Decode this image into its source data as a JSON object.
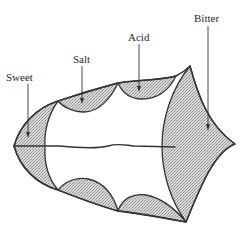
{
  "figure": {
    "colors": {
      "outline": "#333333",
      "stipple_fill": "#c8c8c8",
      "background": "#ffffff"
    },
    "labels": [
      {
        "id": "sweet",
        "text": "Sweet",
        "x": 6,
        "y": 72
      },
      {
        "id": "salt",
        "text": "Salt",
        "x": 72,
        "y": 54
      },
      {
        "id": "acid",
        "text": "Acid",
        "x": 128,
        "y": 32
      },
      {
        "id": "bitter",
        "text": "Bitter",
        "x": 195,
        "y": 14
      }
    ]
  }
}
